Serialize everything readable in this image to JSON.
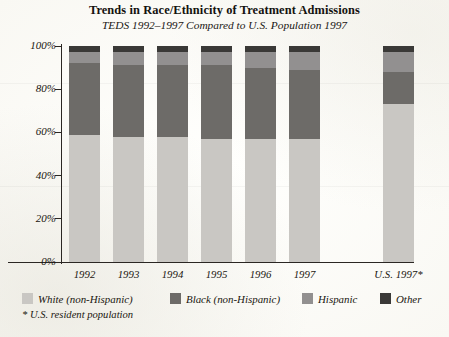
{
  "header": {
    "title": "Trends in Race/Ethnicity of Treatment Admissions",
    "subtitle": "TEDS 1992–1997 Compared to U.S. Population 1997"
  },
  "footnote": "* U.S. resident population",
  "colors": {
    "white": "#c9c7c3",
    "black": "#6d6b68",
    "hispanic": "#929090",
    "other": "#3a3937",
    "axis": "#2b2723",
    "background": "#fdfdfb",
    "text": "#19160f"
  },
  "chart_data": {
    "type": "bar",
    "stacked": true,
    "stacked_mode": "percent",
    "title": "Trends in Race/Ethnicity of Treatment Admissions",
    "subtitle": "TEDS 1992–1997 Compared to U.S. Population 1997",
    "xlabel": "",
    "ylabel": "",
    "ylim": [
      0,
      100
    ],
    "yticks": [
      0,
      20,
      40,
      60,
      80,
      100
    ],
    "ytick_labels": [
      "0%",
      "20%",
      "40%",
      "60%",
      "80%",
      "100%"
    ],
    "grid": false,
    "legend_position": "bottom",
    "categories": [
      "1992",
      "1993",
      "1994",
      "1995",
      "1996",
      "1997",
      "U.S. 1997*"
    ],
    "series": [
      {
        "name": "White (non-Hispanic)",
        "color": "#c9c7c3",
        "values": [
          59,
          58,
          58,
          57,
          57,
          57,
          73
        ]
      },
      {
        "name": "Black (non-Hispanic)",
        "color": "#6d6b68",
        "values": [
          33,
          33,
          33,
          34,
          33,
          32,
          15
        ]
      },
      {
        "name": "Hispanic",
        "color": "#929090",
        "values": [
          5,
          6,
          6,
          6,
          7,
          8,
          9
        ]
      },
      {
        "name": "Other",
        "color": "#3a3937",
        "values": [
          3,
          3,
          3,
          3,
          3,
          3,
          3
        ]
      }
    ],
    "annotations": [
      "* U.S. resident population"
    ]
  }
}
